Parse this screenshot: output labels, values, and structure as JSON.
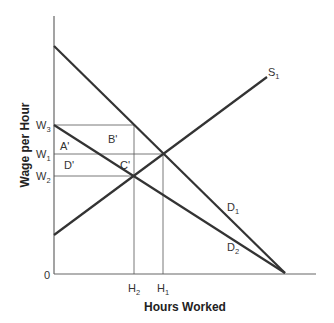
{
  "diagram": {
    "type": "labor-market-supply-demand",
    "axes": {
      "x_title": "Hours Worked",
      "y_title": "Wage per Hour",
      "origin_label": "0"
    },
    "y_ticks": [
      {
        "base": "W",
        "sub": "3"
      },
      {
        "base": "W",
        "sub": "1"
      },
      {
        "base": "W",
        "sub": "2"
      }
    ],
    "x_ticks": [
      {
        "base": "H",
        "sub": "2"
      },
      {
        "base": "H",
        "sub": "1"
      }
    ],
    "curves": [
      {
        "base": "S",
        "sub": "1",
        "kind": "supply"
      },
      {
        "base": "D",
        "sub": "1",
        "kind": "demand"
      },
      {
        "base": "D",
        "sub": "2",
        "kind": "demand"
      }
    ],
    "regions": [
      "A'",
      "B'",
      "C'",
      "D'"
    ],
    "colors": {
      "curve": "#333333",
      "guide": "#555555",
      "axis": "#666666",
      "text": "#333333"
    }
  }
}
